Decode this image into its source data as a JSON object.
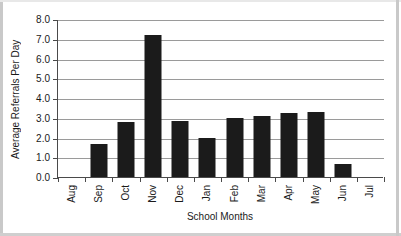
{
  "chart_data": {
    "type": "bar",
    "title": "",
    "xlabel": "School Months",
    "ylabel": "Average Referrals Per Day",
    "categories": [
      "Aug",
      "Sep",
      "Oct",
      "Nov",
      "Dec",
      "Jan",
      "Feb",
      "Mar",
      "Apr",
      "May",
      "Jun",
      "Jul"
    ],
    "values": [
      0,
      1.65,
      2.8,
      7.2,
      2.85,
      2.0,
      3.0,
      3.1,
      3.25,
      3.3,
      0.65,
      0
    ],
    "ylim": [
      0,
      8
    ],
    "ytick_labels": [
      "8.0",
      "7.0",
      "6.0",
      "5.0",
      "4.0",
      "3.0",
      "2.0",
      "1.0",
      "0.0"
    ],
    "ytick_values": [
      8,
      7,
      6,
      5,
      4,
      3,
      2,
      1,
      0
    ],
    "grid": true,
    "legend": "none",
    "series": [
      {
        "name": "Average Referrals Per Day",
        "values": [
          0,
          1.65,
          2.8,
          7.2,
          2.85,
          2.0,
          3.0,
          3.1,
          3.25,
          3.3,
          0.65,
          0
        ]
      }
    ],
    "bar_color": "#1b1b1b",
    "grid_color": "#9a9a9a",
    "axis_color": "#4a4a4a",
    "background": "#ffffff"
  }
}
